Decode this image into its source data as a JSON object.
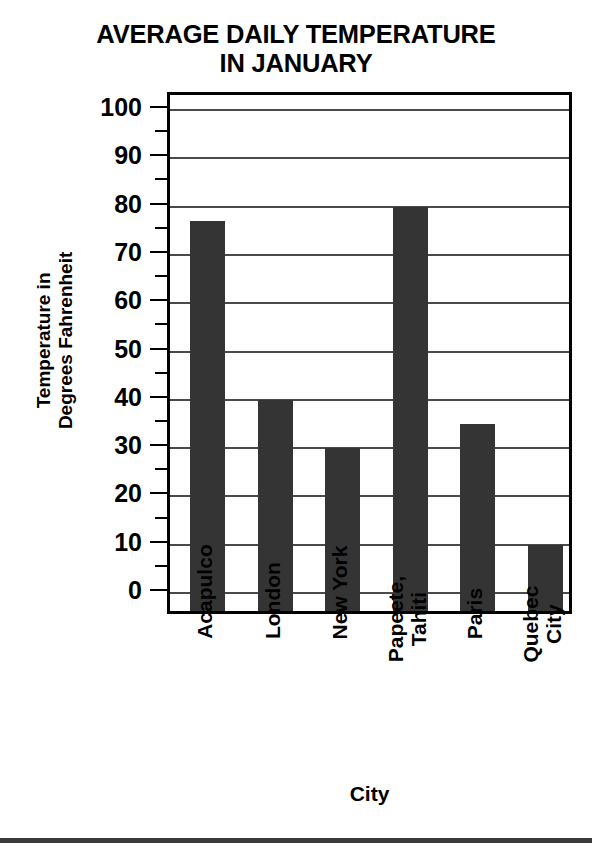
{
  "chart_data": {
    "type": "bar",
    "title": "AVERAGE DAILY TEMPERATURE IN JANUARY",
    "title_lines": [
      "AVERAGE DAILY TEMPERATURE",
      "IN JANUARY"
    ],
    "xlabel": "City",
    "ylabel": "Temperature in Degrees Fahrenheit",
    "ylabel_lines": [
      "Temperature in",
      "Degrees Fahrenheit"
    ],
    "categories": [
      "Acapulco",
      "London",
      "New York",
      "Papeete, Tahiti",
      "Paris",
      "Quebec City"
    ],
    "category_lines": [
      [
        "Acapulco"
      ],
      [
        "London"
      ],
      [
        "New York"
      ],
      [
        "Papeete,",
        "Tahiti"
      ],
      [
        "Paris"
      ],
      [
        "Quebec",
        "City"
      ]
    ],
    "values": [
      77,
      40,
      30,
      80,
      35,
      10
    ],
    "ylim": [
      0,
      100
    ],
    "ymajor_step": 10,
    "yminor_step": 5,
    "ytick_labels": [
      "100",
      "90",
      "80",
      "70",
      "60",
      "50",
      "40",
      "30",
      "20",
      "10",
      "0"
    ],
    "ytick_values": [
      100,
      90,
      80,
      70,
      60,
      50,
      40,
      30,
      20,
      10,
      0
    ],
    "yminor_values": [
      95,
      85,
      75,
      65,
      55,
      45,
      35,
      25,
      15,
      5
    ],
    "grid": true,
    "legend": "none",
    "bar_color": "#343434",
    "grid_color": "#4a4a4a",
    "axis_color": "#000000",
    "background_color": "#ffffff"
  }
}
